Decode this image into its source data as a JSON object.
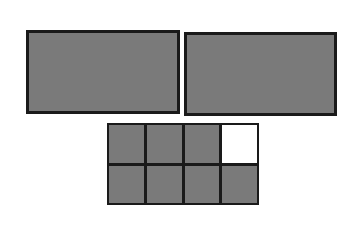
{
  "diagram": {
    "large_rectangles": [
      {
        "id": "left",
        "shaded": true
      },
      {
        "id": "right",
        "shaded": true
      }
    ],
    "grid": {
      "columns": 4,
      "rows": 2,
      "cells": [
        {
          "row": 1,
          "col": 1,
          "shaded": true
        },
        {
          "row": 1,
          "col": 2,
          "shaded": true
        },
        {
          "row": 1,
          "col": 3,
          "shaded": true
        },
        {
          "row": 1,
          "col": 4,
          "shaded": false
        },
        {
          "row": 2,
          "col": 1,
          "shaded": true
        },
        {
          "row": 2,
          "col": 2,
          "shaded": true
        },
        {
          "row": 2,
          "col": 3,
          "shaded": true
        },
        {
          "row": 2,
          "col": 4,
          "shaded": true
        }
      ],
      "shaded_count": 7,
      "total_count": 8
    },
    "colors": {
      "fill": "#7a7a7a",
      "border": "#1a1a1a",
      "empty": "#ffffff"
    }
  }
}
